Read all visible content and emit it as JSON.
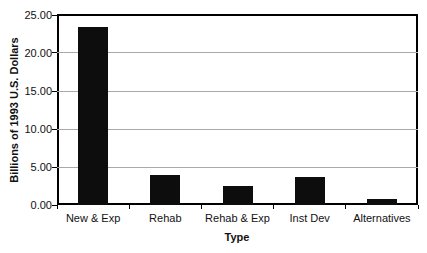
{
  "chart_data": {
    "type": "bar",
    "title": "",
    "xlabel": "Type",
    "ylabel": "Billions of 1993 U.S. Dollars",
    "categories": [
      "New & Exp",
      "Rehab",
      "Rehab & Exp",
      "Inst Dev",
      "Alternatives"
    ],
    "values": [
      23.4,
      4.0,
      2.5,
      3.7,
      0.8
    ],
    "ylim": [
      0,
      25
    ],
    "ytick_values": [
      0,
      5,
      10,
      15,
      20,
      25
    ],
    "ytick_labels": [
      "0.00",
      "5.00",
      "10.00",
      "15.00",
      "20.00",
      "25.00"
    ],
    "grid": true,
    "legend": "none",
    "bar_color": "#0d0d0d",
    "gridline_color": "#aaaaaa",
    "axis_color": "#000000"
  }
}
